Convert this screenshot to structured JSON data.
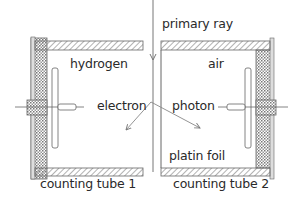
{
  "diagram": {
    "labels": {
      "primary_ray": "primary ray",
      "hydrogen": "hydrogen",
      "air": "air",
      "electron": "electron",
      "photon": "photon",
      "platin_foil": "platin foil",
      "counting_tube_1": "counting tube 1",
      "counting_tube_2": "counting tube 2"
    },
    "colors": {
      "line": "#555555",
      "text": "#2a2a2a",
      "hatch": "#777777",
      "background": "#ffffff"
    }
  }
}
